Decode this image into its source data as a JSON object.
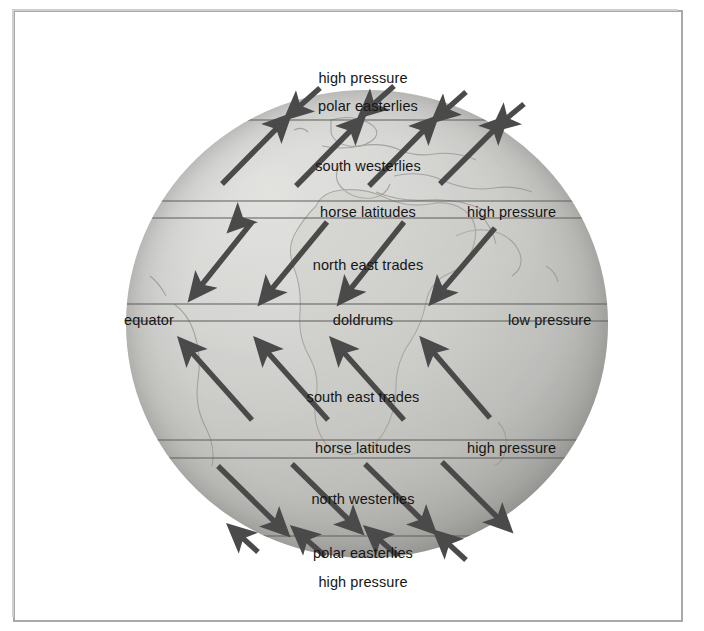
{
  "diagram": {
    "type": "diagram",
    "frame_border_color": "#a9a9a9",
    "arrow_color": "#4a4a4a",
    "globe_base_color": "#cbcbc8",
    "text_color": "#161616"
  },
  "labels": [
    {
      "id": "high-pressure-north-pole",
      "text": "high pressure",
      "x": 363,
      "y": 71,
      "align": "center"
    },
    {
      "id": "polar-easterlies-north",
      "text": "polar easterlies",
      "x": 368,
      "y": 99,
      "align": "center"
    },
    {
      "id": "south-westerlies",
      "text": "south westerlies",
      "x": 368,
      "y": 159,
      "align": "center"
    },
    {
      "id": "horse-latitudes-north",
      "text": "horse latitudes",
      "x": 368,
      "y": 205,
      "align": "center"
    },
    {
      "id": "high-pressure-north",
      "text": "high pressure",
      "x": 467,
      "y": 205,
      "align": "left"
    },
    {
      "id": "north-east-trades",
      "text": "north east trades",
      "x": 368,
      "y": 258,
      "align": "center"
    },
    {
      "id": "equator",
      "text": "equator",
      "x": 124,
      "y": 313,
      "align": "left"
    },
    {
      "id": "doldrums",
      "text": "doldrums",
      "x": 363,
      "y": 313,
      "align": "center"
    },
    {
      "id": "low-pressure",
      "text": "low pressure",
      "x": 508,
      "y": 313,
      "align": "left"
    },
    {
      "id": "south-east-trades",
      "text": "south east trades",
      "x": 363,
      "y": 390,
      "align": "center"
    },
    {
      "id": "horse-latitudes-south",
      "text": "horse latitudes",
      "x": 363,
      "y": 441,
      "align": "center"
    },
    {
      "id": "high-pressure-south",
      "text": "high pressure",
      "x": 467,
      "y": 447,
      "align": "left"
    },
    {
      "id": "north-westerlies",
      "text": "north westerlies",
      "x": 363,
      "y": 492,
      "align": "center"
    },
    {
      "id": "polar-easterlies-south",
      "text": "polar easterlies",
      "x": 363,
      "y": 546,
      "align": "center"
    },
    {
      "id": "high-pressure-south-pole",
      "text": "high pressure",
      "x": 363,
      "y": 575,
      "align": "center"
    }
  ],
  "wind_belts": [
    {
      "name": "polar easterlies",
      "hemisphere": "north",
      "pressure": "high pressure",
      "direction": "down-left"
    },
    {
      "name": "south westerlies",
      "hemisphere": "north",
      "pressure": "",
      "direction": "up-right"
    },
    {
      "name": "horse latitudes",
      "hemisphere": "north",
      "pressure": "high pressure",
      "direction": "none"
    },
    {
      "name": "north east trades",
      "hemisphere": "north",
      "pressure": "",
      "direction": "down-left"
    },
    {
      "name": "doldrums",
      "hemisphere": "equator",
      "pressure": "low pressure",
      "direction": "none"
    },
    {
      "name": "south east trades",
      "hemisphere": "south",
      "pressure": "",
      "direction": "up-left"
    },
    {
      "name": "horse latitudes",
      "hemisphere": "south",
      "pressure": "high pressure",
      "direction": "none"
    },
    {
      "name": "north westerlies",
      "hemisphere": "south",
      "pressure": "",
      "direction": "down-right"
    },
    {
      "name": "polar easterlies",
      "hemisphere": "south",
      "pressure": "high pressure",
      "direction": "up-left"
    }
  ]
}
